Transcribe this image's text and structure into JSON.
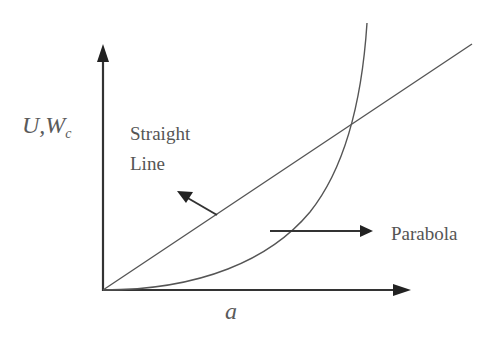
{
  "diagram": {
    "y_axis_label": {
      "main": "U,W",
      "subscript": "c"
    },
    "x_axis_label": "a",
    "annotations": {
      "straight_line_line1": "Straight",
      "straight_line_line2": "Line",
      "parabola": "Parabola"
    },
    "curves": [
      {
        "name": "Straight Line",
        "type": "linear",
        "from": "origin",
        "description": "straight line rising from origin"
      },
      {
        "name": "Parabola",
        "type": "curve",
        "from": "origin",
        "description": "convex curve rising steeply, intersecting straight line"
      }
    ],
    "colors": {
      "stroke": "#555555",
      "axis": "#333333",
      "text": "#555555",
      "background": "#ffffff"
    }
  }
}
